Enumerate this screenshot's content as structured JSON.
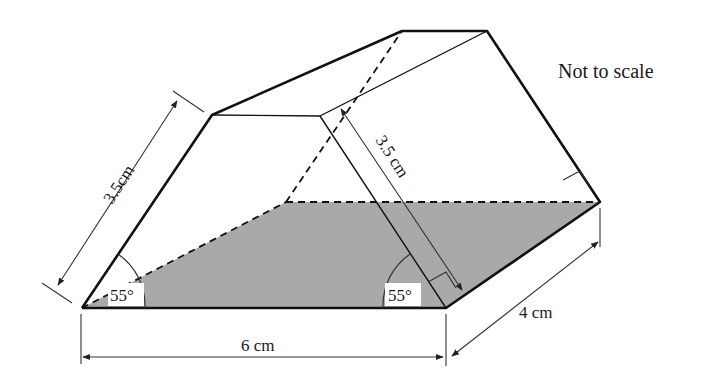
{
  "figure": {
    "type": "trapezoidal prism (3D, isometric sketch)",
    "note": "Not to scale",
    "labels": {
      "slant_edge": "3.5cm",
      "slant_height": "3.5 cm",
      "base_length": "6 cm",
      "depth": "4 cm",
      "angle_left": "55°",
      "angle_right": "55°"
    },
    "colors": {
      "line": "#111111",
      "dim_line": "#444444",
      "shaded_face": "#a9a9a9",
      "label_bg": "#ffffff"
    }
  }
}
